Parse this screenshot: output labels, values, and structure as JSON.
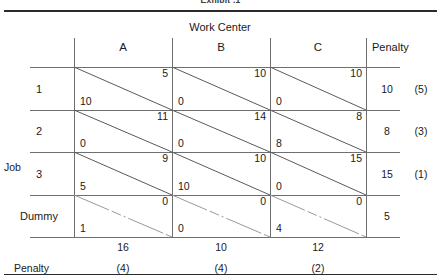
{
  "figure": {
    "cropped_title": "Exhibit .1",
    "column_group_header": "Work Center",
    "row_group_header": "Job",
    "penalty_header": "Penalty",
    "bottom_penalty_label": "Penalty"
  },
  "columns": [
    {
      "label": "A",
      "demand": "16",
      "penalty": "(4)"
    },
    {
      "label": "B",
      "demand": "10",
      "penalty": "(4)"
    },
    {
      "label": "C",
      "demand": "12",
      "penalty": "(2)"
    }
  ],
  "rows": [
    {
      "label": "1",
      "supply": "10",
      "penalty": "(5)",
      "dummy": false,
      "cells": [
        {
          "cost": "5",
          "alloc": "10"
        },
        {
          "cost": "10",
          "alloc": "0"
        },
        {
          "cost": "10",
          "alloc": "0"
        }
      ]
    },
    {
      "label": "2",
      "supply": "8",
      "penalty": "(3)",
      "dummy": false,
      "cells": [
        {
          "cost": "11",
          "alloc": "0"
        },
        {
          "cost": "14",
          "alloc": "0"
        },
        {
          "cost": "8",
          "alloc": "8"
        }
      ]
    },
    {
      "label": "3",
      "supply": "15",
      "penalty": "(1)",
      "dummy": false,
      "cells": [
        {
          "cost": "9",
          "alloc": "5"
        },
        {
          "cost": "10",
          "alloc": "10"
        },
        {
          "cost": "15",
          "alloc": "0"
        }
      ]
    },
    {
      "label": "Dummy",
      "supply": "5",
      "penalty": "",
      "dummy": true,
      "cells": [
        {
          "cost": "0",
          "alloc": "1"
        },
        {
          "cost": "0",
          "alloc": "0"
        },
        {
          "cost": "0",
          "alloc": "4"
        }
      ]
    }
  ],
  "chart_data": {
    "type": "table",
    "xlabel": "Work Center",
    "ylabel": "Job",
    "categories": [
      "A",
      "B",
      "C"
    ],
    "row_categories": [
      "1",
      "2",
      "3",
      "Dummy"
    ],
    "cost_matrix": [
      [
        5,
        10,
        10
      ],
      [
        11,
        14,
        8
      ],
      [
        9,
        10,
        15
      ],
      [
        0,
        0,
        0
      ]
    ],
    "allocation_matrix": [
      [
        10,
        0,
        0
      ],
      [
        0,
        0,
        8
      ],
      [
        5,
        10,
        0
      ],
      [
        1,
        0,
        4
      ]
    ],
    "supply": [
      10,
      8,
      15,
      5
    ],
    "demand": [
      16,
      10,
      12
    ],
    "row_penalties": [
      5,
      3,
      1,
      null
    ],
    "column_penalties": [
      4,
      4,
      2
    ],
    "grid": true,
    "legend": "none"
  },
  "geometry": {
    "col_x": [
      74,
      172,
      270,
      366
    ],
    "row_y": [
      67,
      110,
      152,
      195,
      237
    ]
  },
  "colors": {
    "ink": "#1a1a1a",
    "rule": "#2b2b2b",
    "grid": "#6f6f6f",
    "background": "#ffffff"
  }
}
